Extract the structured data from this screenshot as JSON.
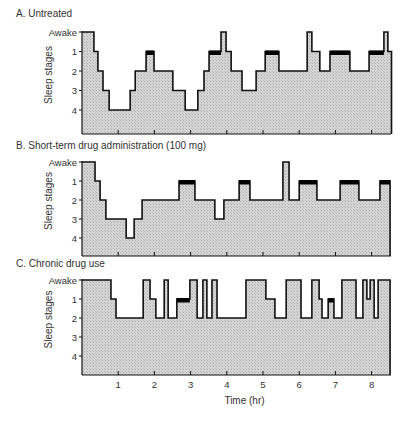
{
  "chart_data": {
    "type": "line",
    "subtype": "hypnogram-step",
    "xlabel": "Time (hr)",
    "ylabel": "Sleep stages",
    "x_ticks": [
      1,
      2,
      3,
      4,
      5,
      6,
      7,
      8
    ],
    "y_levels": [
      "Awake",
      "1",
      "2",
      "3",
      "4"
    ],
    "xlim": [
      0,
      8.55
    ],
    "legend_note": "Black bars on stage 1 segments indicate REM sleep",
    "panels": [
      {
        "id": "A",
        "title": "A. Untreated",
        "segments": [
          {
            "start": 0.0,
            "end": 0.33,
            "stage": "Awake"
          },
          {
            "start": 0.33,
            "end": 0.44,
            "stage": "1"
          },
          {
            "start": 0.44,
            "end": 0.58,
            "stage": "2"
          },
          {
            "start": 0.58,
            "end": 0.75,
            "stage": "3"
          },
          {
            "start": 0.75,
            "end": 1.33,
            "stage": "4"
          },
          {
            "start": 1.33,
            "end": 1.47,
            "stage": "3"
          },
          {
            "start": 1.47,
            "end": 1.77,
            "stage": "2"
          },
          {
            "start": 1.77,
            "end": 1.99,
            "stage": "1",
            "rem": true
          },
          {
            "start": 1.99,
            "end": 2.51,
            "stage": "2"
          },
          {
            "start": 2.51,
            "end": 2.85,
            "stage": "3"
          },
          {
            "start": 2.85,
            "end": 3.2,
            "stage": "4"
          },
          {
            "start": 3.2,
            "end": 3.37,
            "stage": "3"
          },
          {
            "start": 3.37,
            "end": 3.51,
            "stage": "2"
          },
          {
            "start": 3.51,
            "end": 3.84,
            "stage": "1",
            "rem": true
          },
          {
            "start": 3.84,
            "end": 3.98,
            "stage": "Awake"
          },
          {
            "start": 3.98,
            "end": 4.12,
            "stage": "1"
          },
          {
            "start": 4.12,
            "end": 4.42,
            "stage": "2"
          },
          {
            "start": 4.42,
            "end": 4.81,
            "stage": "3"
          },
          {
            "start": 4.81,
            "end": 5.06,
            "stage": "2"
          },
          {
            "start": 5.06,
            "end": 5.44,
            "stage": "1",
            "rem": true
          },
          {
            "start": 5.44,
            "end": 6.22,
            "stage": "2"
          },
          {
            "start": 6.22,
            "end": 6.35,
            "stage": "Awake"
          },
          {
            "start": 6.35,
            "end": 6.57,
            "stage": "1"
          },
          {
            "start": 6.57,
            "end": 6.85,
            "stage": "2"
          },
          {
            "start": 6.85,
            "end": 7.4,
            "stage": "1",
            "rem": true
          },
          {
            "start": 7.4,
            "end": 7.93,
            "stage": "2"
          },
          {
            "start": 7.93,
            "end": 8.34,
            "stage": "1",
            "rem": true
          },
          {
            "start": 8.34,
            "end": 8.45,
            "stage": "Awake"
          },
          {
            "start": 8.45,
            "end": 8.55,
            "stage": "1"
          }
        ]
      },
      {
        "id": "B",
        "title": "B. Short-term drug administration (100 mg)",
        "segments": [
          {
            "start": 0.0,
            "end": 0.36,
            "stage": "Awake"
          },
          {
            "start": 0.36,
            "end": 0.5,
            "stage": "1"
          },
          {
            "start": 0.5,
            "end": 0.66,
            "stage": "2"
          },
          {
            "start": 0.66,
            "end": 1.22,
            "stage": "3"
          },
          {
            "start": 1.22,
            "end": 1.44,
            "stage": "4"
          },
          {
            "start": 1.44,
            "end": 1.66,
            "stage": "3"
          },
          {
            "start": 1.66,
            "end": 2.68,
            "stage": "2"
          },
          {
            "start": 2.68,
            "end": 3.12,
            "stage": "1",
            "rem": true
          },
          {
            "start": 3.12,
            "end": 3.67,
            "stage": "2"
          },
          {
            "start": 3.67,
            "end": 3.92,
            "stage": "3"
          },
          {
            "start": 3.92,
            "end": 4.34,
            "stage": "2"
          },
          {
            "start": 4.34,
            "end": 4.64,
            "stage": "1",
            "rem": true
          },
          {
            "start": 4.64,
            "end": 5.55,
            "stage": "2"
          },
          {
            "start": 5.55,
            "end": 5.72,
            "stage": "Awake"
          },
          {
            "start": 5.72,
            "end": 6.0,
            "stage": "2"
          },
          {
            "start": 6.0,
            "end": 6.49,
            "stage": "1",
            "rem": true
          },
          {
            "start": 6.49,
            "end": 7.13,
            "stage": "2"
          },
          {
            "start": 7.13,
            "end": 7.65,
            "stage": "1",
            "rem": true
          },
          {
            "start": 7.65,
            "end": 8.23,
            "stage": "2"
          },
          {
            "start": 8.23,
            "end": 8.51,
            "stage": "1",
            "rem": true
          }
        ]
      },
      {
        "id": "C",
        "title": "C. Chronic drug use",
        "segments": [
          {
            "start": 0.0,
            "end": 0.8,
            "stage": "Awake"
          },
          {
            "start": 0.8,
            "end": 0.94,
            "stage": "1"
          },
          {
            "start": 0.94,
            "end": 1.69,
            "stage": "2"
          },
          {
            "start": 1.69,
            "end": 1.88,
            "stage": "Awake"
          },
          {
            "start": 1.88,
            "end": 2.04,
            "stage": "1"
          },
          {
            "start": 2.04,
            "end": 2.27,
            "stage": "2"
          },
          {
            "start": 2.27,
            "end": 2.38,
            "stage": "Awake"
          },
          {
            "start": 2.38,
            "end": 2.62,
            "stage": "2"
          },
          {
            "start": 2.62,
            "end": 2.98,
            "stage": "1",
            "rem": true
          },
          {
            "start": 2.98,
            "end": 3.18,
            "stage": "Awake"
          },
          {
            "start": 3.18,
            "end": 3.34,
            "stage": "2"
          },
          {
            "start": 3.34,
            "end": 3.45,
            "stage": "Awake"
          },
          {
            "start": 3.45,
            "end": 3.59,
            "stage": "2"
          },
          {
            "start": 3.59,
            "end": 3.73,
            "stage": "Awake"
          },
          {
            "start": 3.73,
            "end": 4.53,
            "stage": "2"
          },
          {
            "start": 4.53,
            "end": 5.08,
            "stage": "Awake"
          },
          {
            "start": 5.08,
            "end": 5.33,
            "stage": "1"
          },
          {
            "start": 5.33,
            "end": 5.64,
            "stage": "2"
          },
          {
            "start": 5.64,
            "end": 6.05,
            "stage": "Awake"
          },
          {
            "start": 6.05,
            "end": 6.35,
            "stage": "2"
          },
          {
            "start": 6.35,
            "end": 6.55,
            "stage": "Awake"
          },
          {
            "start": 6.55,
            "end": 6.63,
            "stage": "1"
          },
          {
            "start": 6.63,
            "end": 6.8,
            "stage": "2"
          },
          {
            "start": 6.8,
            "end": 6.96,
            "stage": "1",
            "rem": true
          },
          {
            "start": 6.96,
            "end": 7.18,
            "stage": "2"
          },
          {
            "start": 7.18,
            "end": 7.57,
            "stage": "Awake"
          },
          {
            "start": 7.57,
            "end": 7.76,
            "stage": "2"
          },
          {
            "start": 7.76,
            "end": 7.87,
            "stage": "Awake"
          },
          {
            "start": 7.87,
            "end": 7.96,
            "stage": "1"
          },
          {
            "start": 7.96,
            "end": 8.07,
            "stage": "Awake"
          },
          {
            "start": 8.07,
            "end": 8.18,
            "stage": "2"
          },
          {
            "start": 8.18,
            "end": 8.51,
            "stage": "Awake"
          }
        ]
      }
    ]
  },
  "layout": {
    "fill_color": "#cfcfcf",
    "line_color": "#111111",
    "rem_color": "#000000",
    "x0_px": 82,
    "px_per_hr": 36.2,
    "plot_right_px": 391,
    "panels": [
      {
        "title_y": 9,
        "awake_y": 32,
        "step": 19.5,
        "bottom": 134,
        "ticks_y": 134,
        "label_x": 75
      },
      {
        "title_y": 140,
        "awake_y": 162,
        "step": 19.0,
        "bottom": 256,
        "ticks_y": 256,
        "label_x": 75
      },
      {
        "title_y": 258,
        "awake_y": 280,
        "step": 19.0,
        "bottom": 375,
        "ticks_y": 375,
        "label_x": 75
      }
    ]
  }
}
